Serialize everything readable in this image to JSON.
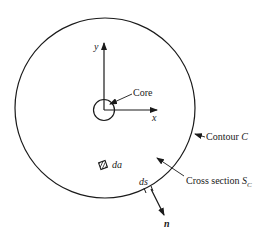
{
  "figure": {
    "labels": {
      "y_axis": "y",
      "x_axis": "x",
      "core": "Core",
      "contour": "Contour",
      "contour_symbol": "C",
      "cross_section": "Cross section",
      "cross_section_symbol": "S",
      "cross_section_subscript": "C",
      "area_element": "da",
      "line_element": "ds",
      "normal": "n"
    },
    "colors": {
      "stroke": "#1a1a1a",
      "background": "#ffffff"
    }
  }
}
